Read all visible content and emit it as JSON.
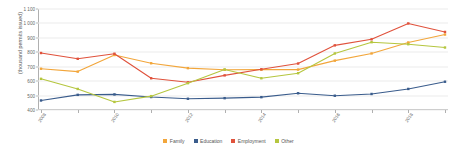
{
  "chart_data": {
    "type": "line",
    "title": "",
    "xlabel": "",
    "ylabel": "(thousand permits issued)",
    "ylim": [
      400,
      1100
    ],
    "ytick_labels": [
      "1 100",
      "1 000",
      "900",
      "800",
      "700",
      "600",
      "500",
      "400"
    ],
    "ytick_values": [
      1100,
      1000,
      900,
      800,
      700,
      600,
      500,
      400
    ],
    "grid": true,
    "legend_position": "bottom",
    "categories": [
      "2008",
      "2009",
      "2010",
      "2011",
      "2012",
      "2013",
      "2014",
      "2015",
      "2016",
      "2017",
      "2018",
      "2019"
    ],
    "xtick_labels_shown": [
      "2008",
      "2010",
      "2012",
      "2014",
      "2016",
      "2018"
    ],
    "series": [
      {
        "name": "Family",
        "color": "#f2a63b",
        "values": [
          686,
          666,
          781,
          724,
          690,
          679,
          680,
          680,
          742,
          792,
          868,
          923
        ]
      },
      {
        "name": "Education",
        "color": "#3a5c8c",
        "values": [
          466,
          505,
          508,
          490,
          478,
          482,
          489,
          516,
          499,
          511,
          546,
          596
        ]
      },
      {
        "name": "Employment",
        "color": "#e0523c",
        "values": [
          795,
          755,
          790,
          620,
          592,
          640,
          682,
          722,
          848,
          890,
          1000,
          941
        ]
      },
      {
        "name": "Other",
        "color": "#b5c63f",
        "values": [
          616,
          546,
          456,
          496,
          586,
          681,
          620,
          655,
          792,
          870,
          856,
          833
        ]
      }
    ]
  },
  "legend": {
    "items": [
      {
        "label": "Family",
        "color": "#f2a63b"
      },
      {
        "label": "Education",
        "color": "#3a5c8c"
      },
      {
        "label": "Employment",
        "color": "#e0523c"
      },
      {
        "label": "Other",
        "color": "#b5c63f"
      }
    ]
  }
}
